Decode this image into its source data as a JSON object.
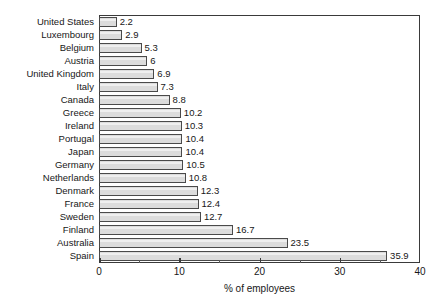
{
  "chart_data": {
    "type": "bar",
    "orientation": "horizontal",
    "title": "",
    "subtitle": "",
    "xlabel": "% of employees",
    "ylabel": "",
    "xlim": [
      0,
      40
    ],
    "xticks": [
      0,
      10,
      20,
      30,
      40
    ],
    "xticklabels": [
      "0",
      "10",
      "20",
      "30",
      "40"
    ],
    "minor_xticks": [
      5,
      15,
      25,
      35
    ],
    "grid": false,
    "legend": null,
    "bar_color": "#dcdcdc",
    "bar_border_color": "#4a4a4a",
    "axis_color": "#3a3a3a",
    "background": "#ffffff",
    "categories": [
      "United States",
      "Luxembourg",
      "Belgium",
      "Austria",
      "United Kingdom",
      "Italy",
      "Canada",
      "Greece",
      "Ireland",
      "Portugal",
      "Japan",
      "Germany",
      "Netherlands",
      "Denmark",
      "France",
      "Sweden",
      "Finland",
      "Australia",
      "Spain"
    ],
    "values": [
      2.2,
      2.9,
      5.3,
      6,
      6.9,
      7.3,
      8.8,
      10.2,
      10.3,
      10.4,
      10.4,
      10.5,
      10.8,
      12.3,
      12.4,
      12.7,
      16.7,
      23.5,
      35.9
    ],
    "value_labels": [
      "2.2",
      "2.9",
      "5.3",
      "6",
      "6.9",
      "7.3",
      "8.8",
      "10.2",
      "10.3",
      "10.4",
      "10.4",
      "10.5",
      "10.8",
      "12.3",
      "12.4",
      "12.7",
      "16.7",
      "23.5",
      "35.9"
    ]
  }
}
